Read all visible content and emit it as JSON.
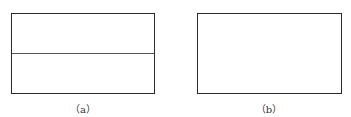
{
  "figure": {
    "panels": [
      {
        "id": "a",
        "label": "（a）",
        "has_horizontal_divider": true
      },
      {
        "id": "b",
        "label": "（b）",
        "has_horizontal_divider": false
      }
    ],
    "line_color": "#2a2a2a"
  }
}
